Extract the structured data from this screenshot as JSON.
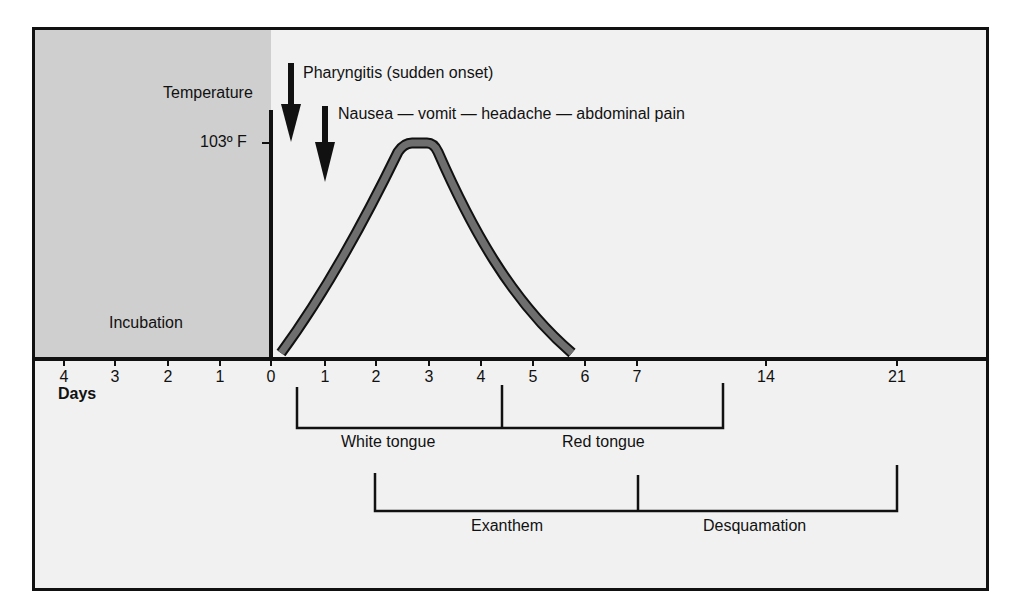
{
  "chart_data": {
    "type": "line",
    "title": "",
    "xlabel": "Days",
    "ylabel": "Temperature",
    "y_marker": "103º F",
    "x_ticks_before_onset": [
      "4",
      "3",
      "2",
      "1",
      "0"
    ],
    "x_ticks_after_onset": [
      "1",
      "2",
      "3",
      "4",
      "5",
      "6",
      "7",
      "14",
      "21"
    ],
    "shaded_region": {
      "label": "Incubation",
      "from_day": -4.5,
      "to_day": 0
    },
    "series": [
      {
        "name": "Temperature curve",
        "x": [
          0.2,
          1.0,
          2.0,
          2.5,
          3.0,
          4.0,
          5.0,
          5.8
        ],
        "y": [
          "baseline",
          "rising",
          "high",
          "103º F peak",
          "103º F peak",
          "falling",
          "low",
          "baseline"
        ]
      }
    ],
    "events": [
      {
        "label": "Pharyngitis (sudden onset)",
        "day": 0.35,
        "marker": "down-arrow"
      },
      {
        "label": "Nausea — vomit — headache — abdominal pain",
        "day": 1.0,
        "marker": "down-arrow"
      }
    ],
    "phases": [
      {
        "label": "White tongue",
        "from_day": 0.5,
        "to_day": 4.4,
        "row": 1
      },
      {
        "label": "Red tongue",
        "from_day": 4.4,
        "to_day": 10,
        "row": 1
      },
      {
        "label": "Exanthem",
        "from_day": 2,
        "to_day": 7,
        "row": 2
      },
      {
        "label": "Desquamation",
        "from_day": 7,
        "to_day": 21,
        "row": 2
      }
    ]
  },
  "labels": {
    "temperature": "Temperature",
    "temp_marker": "103º F",
    "pharyngitis": "Pharyngitis (sudden onset)",
    "symptoms": "Nausea — vomit — headache — abdominal pain",
    "incubation": "Incubation",
    "days": "Days",
    "white_tongue": "White tongue",
    "red_tongue": "Red tongue",
    "exanthem": "Exanthem",
    "desquamation": "Desquamation"
  },
  "ticks": [
    {
      "label": "4",
      "x": 64
    },
    {
      "label": "3",
      "x": 115
    },
    {
      "label": "2",
      "x": 168
    },
    {
      "label": "1",
      "x": 220
    },
    {
      "label": "0",
      "x": 271
    },
    {
      "label": "1",
      "x": 325
    },
    {
      "label": "2",
      "x": 376
    },
    {
      "label": "3",
      "x": 429
    },
    {
      "label": "4",
      "x": 481
    },
    {
      "label": "5",
      "x": 533
    },
    {
      "label": "6",
      "x": 585
    },
    {
      "label": "7",
      "x": 637
    },
    {
      "label": "14",
      "x": 766
    },
    {
      "label": "21",
      "x": 897
    }
  ],
  "colors": {
    "background": "#f1f1f1",
    "incubation_shade": "#cfcfcf",
    "curve_fill": "#6e6e6e",
    "ink": "#111111"
  }
}
